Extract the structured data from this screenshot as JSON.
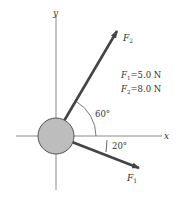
{
  "diagram": {
    "axes": {
      "x_label": "x",
      "y_label": "y"
    },
    "forces": [
      {
        "name": "F1",
        "symbol": "F",
        "subscript": "1",
        "magnitude": "5.0 N",
        "angle_deg": -20,
        "angle_label": "20°"
      },
      {
        "name": "F2",
        "symbol": "F",
        "subscript": "2",
        "magnitude": "8.0 N",
        "angle_deg": 60,
        "angle_label": "60°"
      }
    ],
    "legend": {
      "line1": {
        "symbol": "F",
        "subscript": "1",
        "eq": "=5.0 N"
      },
      "line2": {
        "symbol": "F",
        "subscript": "2",
        "eq": "=8.0 N"
      }
    },
    "colors": {
      "object_fill": "#bdbdbd",
      "arrow": "#444444",
      "axis": "#8a8a8a",
      "text": "#333333"
    }
  }
}
